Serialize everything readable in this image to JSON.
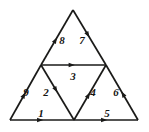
{
  "figure": {
    "type": "geometric-diagram",
    "canvas": {
      "width": 149,
      "height": 132
    },
    "background_color": "#ffffff",
    "stroke_color": "#1a1a18",
    "label_color": "#141412",
    "vertices": [
      {
        "id": "A",
        "name": "apex",
        "x": 73,
        "y": 10
      },
      {
        "id": "B",
        "name": "bottom-left",
        "x": 10,
        "y": 120
      },
      {
        "id": "C",
        "name": "bottom-right",
        "x": 138,
        "y": 120
      },
      {
        "id": "MA",
        "name": "midpoint-left",
        "x": 41,
        "y": 65
      },
      {
        "id": "MC",
        "name": "midpoint-right",
        "x": 106,
        "y": 65
      },
      {
        "id": "MB",
        "name": "midpoint-bottom",
        "x": 74,
        "y": 120
      }
    ],
    "edges": [
      {
        "id": "e1",
        "label": "1",
        "from": "B",
        "to": "MB",
        "x1": 10,
        "y1": 120,
        "x2": 74,
        "y2": 120,
        "arrow_at": 0.52,
        "label_x": 41,
        "label_y": 113,
        "direction": "right"
      },
      {
        "id": "e2",
        "label": "2",
        "from": "MA",
        "to": "MB",
        "x1": 41,
        "y1": 65,
        "x2": 74,
        "y2": 120,
        "arrow_at": 0.5,
        "label_x": 46,
        "label_y": 92,
        "direction": "down-right"
      },
      {
        "id": "e3",
        "label": "3",
        "from": "MA",
        "to": "MC",
        "x1": 41,
        "y1": 65,
        "x2": 106,
        "y2": 65,
        "arrow_at": 0.52,
        "label_x": 73,
        "label_y": 76,
        "direction": "right"
      },
      {
        "id": "e4",
        "label": "4",
        "from": "MB",
        "to": "MC",
        "x1": 74,
        "y1": 120,
        "x2": 106,
        "y2": 65,
        "arrow_at": 0.5,
        "label_x": 93,
        "label_y": 92,
        "direction": "up-right"
      },
      {
        "id": "e5",
        "label": "5",
        "from": "MB",
        "to": "C",
        "x1": 74,
        "y1": 120,
        "x2": 138,
        "y2": 120,
        "arrow_at": 0.52,
        "label_x": 107,
        "label_y": 113,
        "direction": "right"
      },
      {
        "id": "e6",
        "label": "6",
        "from": "C",
        "to": "MC",
        "x1": 138,
        "y1": 120,
        "x2": 106,
        "y2": 65,
        "arrow_at": 0.52,
        "label_x": 116,
        "label_y": 92,
        "direction": "up-left"
      },
      {
        "id": "e7",
        "label": "7",
        "from": "A",
        "to": "MC",
        "x1": 73,
        "y1": 10,
        "x2": 106,
        "y2": 65,
        "arrow_at": 0.5,
        "label_x": 82,
        "label_y": 40,
        "direction": "down-right"
      },
      {
        "id": "e8",
        "label": "8",
        "from": "MA",
        "to": "A",
        "x1": 41,
        "y1": 65,
        "x2": 73,
        "y2": 10,
        "arrow_at": 0.5,
        "label_x": 62,
        "label_y": 40,
        "direction": "up-right"
      },
      {
        "id": "e9",
        "label": "9",
        "from": "B",
        "to": "MA",
        "x1": 10,
        "y1": 120,
        "x2": 41,
        "y2": 65,
        "arrow_at": 0.5,
        "label_x": 26,
        "label_y": 92,
        "direction": "up-right"
      }
    ],
    "labels": [
      {
        "id": "l1",
        "text": "1"
      },
      {
        "id": "l2",
        "text": "2"
      },
      {
        "id": "l3",
        "text": "3"
      },
      {
        "id": "l4",
        "text": "4"
      },
      {
        "id": "l5",
        "text": "5"
      },
      {
        "id": "l6",
        "text": "6"
      },
      {
        "id": "l7",
        "text": "7"
      },
      {
        "id": "l8",
        "text": "8"
      },
      {
        "id": "l9",
        "text": "9"
      }
    ]
  }
}
